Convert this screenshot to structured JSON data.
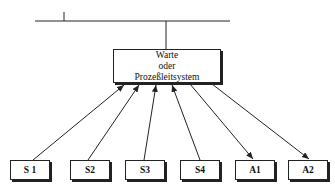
{
  "diagram": {
    "center": {
      "lines": [
        "Warte",
        "oder",
        "Prozeßleitsystem"
      ]
    },
    "nodes": [
      {
        "label": "S 1",
        "direction": "to-center"
      },
      {
        "label": "S2",
        "direction": "to-center"
      },
      {
        "label": "S3",
        "direction": "to-center"
      },
      {
        "label": "S4",
        "direction": "to-center"
      },
      {
        "label": "A1",
        "direction": "from-center"
      },
      {
        "label": "A2",
        "direction": "from-center"
      }
    ],
    "colors": {
      "line": "#222222",
      "background": "#ffffff"
    }
  }
}
